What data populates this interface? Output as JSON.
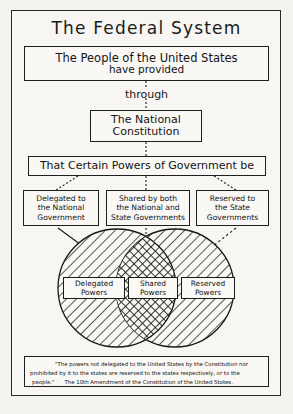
{
  "title": "The Federal System",
  "boxes": {
    "people": {
      "line1": "The People of the United States",
      "line2": "have provided"
    },
    "through": "through",
    "constitution": {
      "line1": "The National",
      "line2": "Constitution"
    },
    "powers": "That Certain Powers of Government be"
  },
  "branches": [
    {
      "line1": "Delegated to",
      "line2": "the National",
      "line3": "Government"
    },
    {
      "line1": "Shared by both",
      "line2": "the National and",
      "line3": "State Governments"
    },
    {
      "line1": "Reserved to",
      "line2": "the State",
      "line3": "Governments"
    }
  ],
  "venn": {
    "left": {
      "line1": "Delegated",
      "line2": "Powers"
    },
    "center": {
      "line1": "Shared",
      "line2": "Powers"
    },
    "right": {
      "line1": "Reserved",
      "line2": "Powers"
    }
  },
  "quote": {
    "line1": "\"The powers not delegated to the United States by the Constitution nor",
    "line2": "prohibited by it to the states are reserved to the states respectively, or to the",
    "line3": "people.\"",
    "line4": "The 10th Amendment of the Constitution of the United States."
  },
  "colors": {
    "ink": "#1f1f1f",
    "paper": "#f7f6f3",
    "background": "#f2f1ee"
  }
}
